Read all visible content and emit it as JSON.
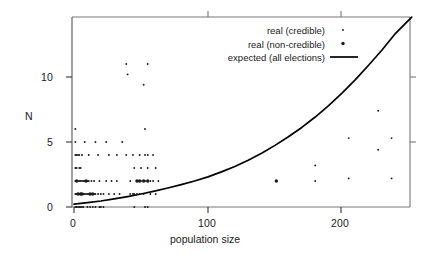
{
  "chart_data": {
    "type": "scatter",
    "title": "",
    "xlabel": "population size",
    "ylabel": "N",
    "xlim": [
      -4,
      252
    ],
    "ylim": [
      -0.55,
      14.6
    ],
    "xticks": [
      0,
      100,
      200
    ],
    "xtick_labels": [
      "0",
      "100",
      "200"
    ],
    "yticks": [
      0,
      5,
      10
    ],
    "ytick_labels": [
      "0",
      "5",
      "10"
    ],
    "grid": false,
    "legend_position": "top-right",
    "legend": [
      {
        "label": "real (credible)",
        "marker": "small-dot",
        "color": "#1a1a1a"
      },
      {
        "label": "real (non-credible)",
        "marker": "large-dot",
        "color": "#1a1a1a"
      },
      {
        "label": "expected (all elections)",
        "marker": "line",
        "color": "#000000"
      }
    ],
    "series": [
      {
        "name": "real (credible)",
        "marker": "small-dot",
        "color": "#1a1a1a",
        "points": [
          [
            1,
            6.0
          ],
          [
            1,
            5.0
          ],
          [
            1,
            4.0
          ],
          [
            1,
            3.0
          ],
          [
            1,
            2.0
          ],
          [
            1,
            1.0
          ],
          [
            1,
            0.0
          ],
          [
            2,
            4.0
          ],
          [
            2,
            3.0
          ],
          [
            2,
            2.0
          ],
          [
            2,
            1.0
          ],
          [
            2,
            0.0
          ],
          [
            3,
            4.0
          ],
          [
            3,
            2.0
          ],
          [
            3,
            1.0
          ],
          [
            3,
            0.0
          ],
          [
            4,
            4.0
          ],
          [
            4,
            3.0
          ],
          [
            4,
            2.0
          ],
          [
            4,
            1.0
          ],
          [
            4,
            0.0
          ],
          [
            5,
            3.0
          ],
          [
            5,
            2.0
          ],
          [
            5,
            1.0
          ],
          [
            5,
            0.0
          ],
          [
            6,
            4.0
          ],
          [
            6,
            2.0
          ],
          [
            6,
            1.0
          ],
          [
            6,
            0.0
          ],
          [
            7,
            2.0
          ],
          [
            7,
            1.0
          ],
          [
            7,
            0.0
          ],
          [
            8,
            5.0
          ],
          [
            8,
            2.0
          ],
          [
            8,
            1.0
          ],
          [
            9,
            2.0
          ],
          [
            9,
            1.0
          ],
          [
            10,
            2.0
          ],
          [
            10,
            1.0
          ],
          [
            10,
            0.0
          ],
          [
            11,
            4.0
          ],
          [
            11,
            2.0
          ],
          [
            11,
            1.0
          ],
          [
            12,
            1.0
          ],
          [
            12,
            0.0
          ],
          [
            13,
            2.0
          ],
          [
            13,
            1.0
          ],
          [
            14,
            1.0
          ],
          [
            14,
            0.0
          ],
          [
            15,
            2.0
          ],
          [
            15,
            1.0
          ],
          [
            16,
            5.0
          ],
          [
            16,
            1.0
          ],
          [
            16,
            0.0
          ],
          [
            18,
            4.0
          ],
          [
            18,
            1.0
          ],
          [
            19,
            2.0
          ],
          [
            19,
            0.0
          ],
          [
            20,
            1.0
          ],
          [
            20,
            0.0
          ],
          [
            22,
            1.0
          ],
          [
            22,
            0.0
          ],
          [
            24,
            5.0
          ],
          [
            24,
            2.0
          ],
          [
            26,
            4.0
          ],
          [
            26,
            1.0
          ],
          [
            28,
            2.0
          ],
          [
            30,
            1.0
          ],
          [
            32,
            4.0
          ],
          [
            32,
            2.0
          ],
          [
            34,
            1.0
          ],
          [
            36,
            5.0
          ],
          [
            39,
            11.0
          ],
          [
            39,
            4.0
          ],
          [
            40,
            10.2
          ],
          [
            42,
            2.0
          ],
          [
            42,
            1.0
          ],
          [
            44,
            4.0
          ],
          [
            44,
            1.0
          ],
          [
            45,
            3.0
          ],
          [
            45,
            1.0
          ],
          [
            45,
            0.0
          ],
          [
            47,
            2.0
          ],
          [
            47,
            1.0
          ],
          [
            49,
            4.0
          ],
          [
            49,
            2.0
          ],
          [
            49,
            1.0
          ],
          [
            50,
            3.0
          ],
          [
            50,
            2.0
          ],
          [
            52,
            9.4
          ],
          [
            52,
            2.0
          ],
          [
            52,
            1.0
          ],
          [
            53,
            6.0
          ],
          [
            53,
            4.0
          ],
          [
            53,
            2.0
          ],
          [
            53,
            0.0
          ],
          [
            55,
            11.0
          ],
          [
            55,
            4.0
          ],
          [
            55,
            3.0
          ],
          [
            55,
            2.0
          ],
          [
            55,
            0.0
          ],
          [
            57,
            2.0
          ],
          [
            57,
            1.0
          ],
          [
            59,
            4.0
          ],
          [
            59,
            2.0
          ],
          [
            61,
            3.0
          ],
          [
            61,
            1.0
          ],
          [
            63,
            2.0
          ],
          [
            151,
            2.0
          ],
          [
            180,
            3.2
          ],
          [
            180,
            2.0
          ],
          [
            205,
            5.3
          ],
          [
            205,
            2.2
          ],
          [
            227,
            7.4
          ],
          [
            227,
            4.4
          ],
          [
            237,
            5.3
          ],
          [
            237,
            2.2
          ]
        ]
      },
      {
        "name": "real (non-credible)",
        "marker": "large-dot",
        "color": "#1a1a1a",
        "points": [
          [
            2,
            2.0
          ],
          [
            3,
            1.0
          ],
          [
            5,
            1.0
          ],
          [
            6,
            1.0
          ],
          [
            9,
            2.0
          ],
          [
            12,
            1.0
          ],
          [
            14,
            1.0
          ],
          [
            47,
            2.0
          ],
          [
            49,
            2.0
          ],
          [
            52,
            2.0
          ],
          [
            55,
            2.0
          ],
          [
            151,
            2.0
          ]
        ]
      }
    ],
    "curve": {
      "name": "expected (all elections)",
      "color": "#000000",
      "description": "monotonic increasing convex curve from N~0.2 at x=0 to N~14.6 at x=252",
      "points": [
        [
          0,
          0.22
        ],
        [
          10,
          0.33
        ],
        [
          20,
          0.46
        ],
        [
          30,
          0.62
        ],
        [
          40,
          0.8
        ],
        [
          50,
          1.0
        ],
        [
          60,
          1.22
        ],
        [
          70,
          1.46
        ],
        [
          80,
          1.72
        ],
        [
          90,
          2.0
        ],
        [
          100,
          2.32
        ],
        [
          110,
          2.7
        ],
        [
          120,
          3.12
        ],
        [
          130,
          3.6
        ],
        [
          140,
          4.14
        ],
        [
          150,
          4.74
        ],
        [
          160,
          5.4
        ],
        [
          170,
          6.12
        ],
        [
          180,
          6.92
        ],
        [
          190,
          7.8
        ],
        [
          200,
          8.76
        ],
        [
          210,
          9.8
        ],
        [
          220,
          10.92
        ],
        [
          230,
          12.1
        ],
        [
          240,
          13.36
        ],
        [
          252,
          14.6
        ]
      ]
    }
  },
  "legend_entries": {
    "credible": "real (credible)",
    "non_credible": "real (non-credible)",
    "expected": "expected (all elections)"
  },
  "axes": {
    "y_label": "N",
    "x_label": "population size",
    "x_tick_0": "0",
    "x_tick_100": "100",
    "x_tick_200": "200",
    "y_tick_0": "0",
    "y_tick_5": "5",
    "y_tick_10": "10"
  }
}
